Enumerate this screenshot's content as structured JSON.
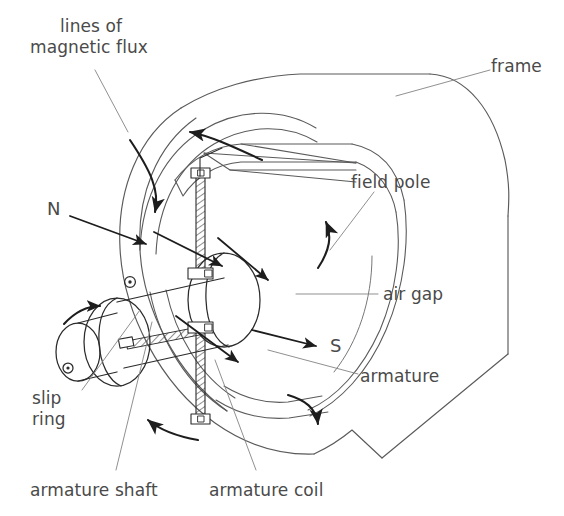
{
  "figure": {
    "kind": "technical-line-diagram",
    "stroke_color": "#2b2b2b",
    "thin_stroke_color": "#6f6f6f",
    "text_color": "#4a4a4a",
    "background": "#ffffff"
  },
  "labels": {
    "lines_of_flux_line1": "lines of",
    "lines_of_flux_line2": "magnetic flux",
    "frame": "frame",
    "field_pole": "field pole",
    "air_gap": "air gap",
    "armature": "armature",
    "armature_shaft": "armature shaft",
    "armature_coil": "armature coil",
    "slip_line1": "slip",
    "slip_line2": "ring",
    "pole_north": "N",
    "pole_south": "S"
  },
  "icons": {
    "shaft_end_dot": "shaft-center-dot-icon",
    "slip_ring_dot": "slip-ring-center-dot-icon"
  }
}
